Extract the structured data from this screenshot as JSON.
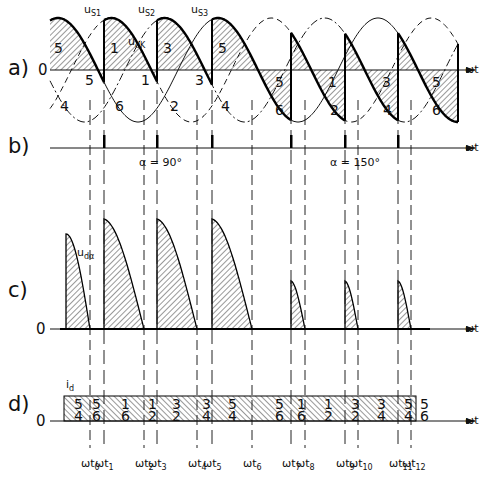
{
  "chart_data": {
    "type": "diagram",
    "panels": [
      {
        "id": "a",
        "label": "a)",
        "description": "Phase voltages u_S1, u_S2, u_S3 (solid/dashed/dash-dot) with shaded u_dα output; thyristor numbers in segments"
      },
      {
        "id": "b",
        "label": "b)",
        "description": "Firing pulses; α = 90° then α = 150°"
      },
      {
        "id": "c",
        "label": "c)",
        "description": "Rectified output voltage u_dα"
      },
      {
        "id": "d",
        "label": "d)",
        "description": "Direct current i_d with conducting thyristor pairs"
      }
    ],
    "voltage_labels": [
      "uS1",
      "uS2",
      "uS3"
    ],
    "udk_label": "udK",
    "udalpha_label": "udα",
    "id_label": "id",
    "alpha_labels": [
      "α = 90°",
      "α = 150°"
    ],
    "zero_label": "0",
    "axis_label": "ωt",
    "time_marks": [
      "ωt0",
      "ωt1",
      "ωt2",
      "ωt3",
      "ωt4",
      "ωt5",
      "ωt6",
      "ωt7",
      "ωt8",
      "ωt9",
      "ωt10",
      "ωt11",
      "ωt12"
    ],
    "time_mark_x": [
      90,
      104,
      144,
      157,
      197,
      212,
      252,
      291,
      305,
      345,
      358,
      398,
      411
    ],
    "pulse_x": [
      104,
      157,
      212,
      291,
      345,
      398
    ],
    "panel_a_upper_numbers": [
      "5",
      "1",
      "3",
      "5",
      "5",
      "1",
      "3",
      "5"
    ],
    "panel_a_lower_numbers": [
      "4",
      "5",
      "6",
      "1",
      "2",
      "3",
      "4",
      "6",
      "2",
      "4",
      "6"
    ],
    "panel_d_top": [
      "5",
      "5",
      "1",
      "1",
      "3",
      "3",
      "5",
      "5",
      "1",
      "1",
      "3",
      "3",
      "5",
      "5"
    ],
    "panel_d_bottom": [
      "4",
      "6",
      "6",
      "2",
      "2",
      "4",
      "4",
      "6",
      "6",
      "2",
      "2",
      "4",
      "4",
      "6"
    ]
  },
  "labels": {
    "a": "a)",
    "b": "b)",
    "c": "c)",
    "d": "d)",
    "zero": "0",
    "wt": "ωt",
    "us1": "u",
    "us1_sub": "S1",
    "us2": "u",
    "us2_sub": "S2",
    "us3": "u",
    "us3_sub": "S3",
    "udk": "u",
    "udk_sub": "dK",
    "udalpha": "u",
    "udalpha_sub": "dα",
    "id": "i",
    "id_sub": "d",
    "alpha90": "α = 90°",
    "alpha150": "α = 150°"
  }
}
